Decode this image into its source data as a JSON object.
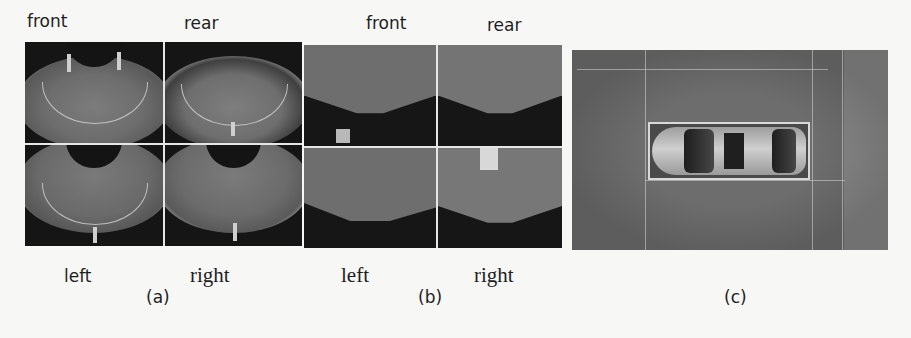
{
  "figure": {
    "panels": [
      {
        "id": "a",
        "caption": "(a)",
        "description": "Raw fisheye camera images",
        "labels": {
          "top_left": "front",
          "top_right": "rear",
          "bottom_left": "left",
          "bottom_right": "right"
        }
      },
      {
        "id": "b",
        "caption": "(b)",
        "description": "Undistorted / perspective-corrected camera images",
        "labels": {
          "top_left": "front",
          "top_right": "rear",
          "bottom_left": "left",
          "bottom_right": "right"
        }
      },
      {
        "id": "c",
        "caption": "(c)",
        "description": "Stitched bird's-eye surround view with car in parking space"
      }
    ],
    "colors": {
      "background": "#f7f7f6",
      "image_dark": "#151515",
      "ground_gray": "#6e6e6e",
      "divider": "#e6e6e6"
    }
  }
}
